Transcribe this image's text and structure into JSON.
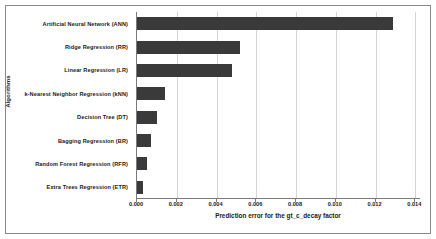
{
  "chart_data": {
    "type": "bar",
    "orientation": "horizontal",
    "title": "",
    "xlabel": "Prediction error for the gt_c_decay factor",
    "ylabel": "Algorithms",
    "categories": [
      "Artificial Neural Network (ANN)",
      "Ridge Regression (RR)",
      "Linear Regression (LR)",
      "k-Nearest Neighbor Regression (kNN)",
      "Decision Tree (DT)",
      "Bagging Regression (BR)",
      "Random Forest Regression (RFR)",
      "Extra Trees Regression (ETR)"
    ],
    "values": [
      0.0129,
      0.0052,
      0.0048,
      0.0014,
      0.001,
      0.0007,
      0.0005,
      0.0003
    ],
    "xlim": [
      0.0,
      0.0142857
    ],
    "xticks": [
      0.0,
      0.002,
      0.004,
      0.006,
      0.008,
      0.01,
      0.012,
      0.014
    ],
    "xtick_labels": [
      "0.000",
      "0.002",
      "0.004",
      "0.006",
      "0.008",
      "0.010",
      "0.012",
      "0.014"
    ],
    "grid": "vertical",
    "legend": "none",
    "bar_color": "#3a3a3a",
    "grid_color": "#d4d4d4",
    "axis_color": "#7a7a7a"
  }
}
